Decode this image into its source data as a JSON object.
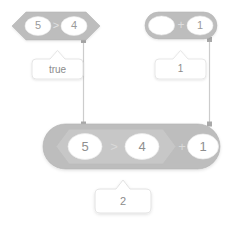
{
  "diagram": {
    "style": {
      "background": "#ffffff",
      "block_fill": "#bdbdbd",
      "block_fill_dark": "#b5b5b5",
      "block_fill_inner": "#c9c9c9",
      "block_stroke": "#b0b0b0",
      "slot_fill": "#ffffff",
      "slot_stroke": "#e3e3e3",
      "connector_color": "#c8c8c8",
      "connector_dot_color": "#a8a8a8",
      "callout_fill": "#ffffff",
      "callout_stroke": "#e0e0e0",
      "text_color": "#8c8c8c",
      "operator_text_color": "#e2e2e2"
    },
    "blocks": [
      {
        "id": "boolean-block-top",
        "name": "greater-than-block",
        "shape": "hexagon",
        "operator": ">",
        "operands": [
          "5",
          "4"
        ],
        "position": {
          "x": 12,
          "y": 12,
          "width": 88,
          "height": 28
        }
      },
      {
        "id": "addition-block-top",
        "name": "addition-block",
        "shape": "rounded",
        "operator": "+",
        "operands": [
          "",
          "1"
        ],
        "position": {
          "x": 145,
          "y": 12,
          "width": 72,
          "height": 27
        }
      },
      {
        "id": "combined-block",
        "name": "combined-addition-block",
        "shape": "rounded",
        "operator": "+",
        "operands": [
          "5 > 4",
          "1"
        ],
        "nested": {
          "shape": "hexagon",
          "operator": ">",
          "operands": [
            "5",
            "4"
          ]
        },
        "position": {
          "x": 43,
          "y": 124,
          "width": 177,
          "height": 45
        }
      }
    ],
    "callouts": [
      {
        "id": "callout-true",
        "name": "result-callout-true",
        "value": "true",
        "position": {
          "x": 32,
          "y": 54,
          "width": 51,
          "height": 25
        },
        "points_to": "boolean-block-top"
      },
      {
        "id": "callout-one",
        "name": "result-callout-one",
        "value": "1",
        "position": {
          "x": 155,
          "y": 54,
          "width": 51,
          "height": 25
        },
        "points_to": "addition-block-top"
      },
      {
        "id": "callout-two",
        "name": "result-callout-two",
        "value": "2",
        "position": {
          "x": 95,
          "y": 185,
          "width": 56,
          "height": 28
        },
        "points_to": "combined-block"
      }
    ],
    "connectors": [
      {
        "id": "connector-left",
        "name": "connector-line-left",
        "from": {
          "x": 83,
          "y": 40
        },
        "to": {
          "x": 83,
          "y": 124
        },
        "endpoint_markers": "square-dots"
      },
      {
        "id": "connector-right",
        "name": "connector-line-right",
        "from": {
          "x": 209,
          "y": 39
        },
        "to": {
          "x": 209,
          "y": 124
        },
        "endpoint_markers": "square-dots"
      }
    ]
  }
}
